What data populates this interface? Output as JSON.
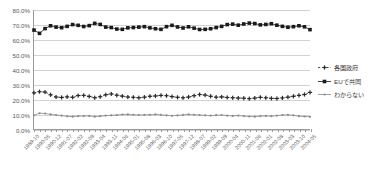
{
  "chart_data": {
    "type": "line",
    "title": "",
    "xlabel": "",
    "ylabel": "",
    "ylim": [
      0,
      80
    ],
    "ytick_values": [
      0,
      10,
      20,
      30,
      40,
      50,
      60,
      70,
      80
    ],
    "ytick_labels": [
      "0.0%",
      "10.0%",
      "20.0%",
      "30.0%",
      "40.0%",
      "50.0%",
      "60.0%",
      "70.0%",
      "80.0%"
    ],
    "grid": true,
    "legend_position": "right",
    "x": [
      "1989-10",
      "1990-01",
      "1990-05",
      "1990-08",
      "1990-12",
      "1991-03",
      "1991-07",
      "1991-10",
      "1992-02",
      "1992-05",
      "1992-09",
      "1992-12",
      "1993-04",
      "1993-07",
      "1993-11",
      "1994-02",
      "1994-06",
      "1994-09",
      "1995-01",
      "1995-04",
      "1995-08",
      "1995-11",
      "1996-03",
      "1996-06",
      "1996-10",
      "1997-01",
      "1997-05",
      "1997-08",
      "1997-12",
      "1998-03",
      "1998-07",
      "1998-10",
      "1999-02",
      "1999-05",
      "1999-09",
      "1999-12",
      "2000-04",
      "2000-07",
      "2000-11",
      "2001-02",
      "2001-06",
      "2001-09",
      "2002-01",
      "2002-04",
      "2002-08",
      "2002-11",
      "2003-03",
      "2003-06",
      "2003-10",
      "2004-01",
      "2004-05"
    ],
    "xtick_labels": [
      "1989-10",
      "1990-05",
      "1990-12",
      "1991-07",
      "1992-02",
      "1992-09",
      "1993-04",
      "1993-11",
      "1994-06",
      "1995-01",
      "1995-08",
      "1996-03",
      "1996-10",
      "1997-05",
      "1997-12",
      "1998-07",
      "1999-02",
      "1999-09",
      "2000-04",
      "2000-11",
      "2001-06",
      "2002-01",
      "2002-08",
      "2003-03",
      "2003-10",
      "2004-05"
    ],
    "xtick_every": 2,
    "series": [
      {
        "name": "EUで共同",
        "color": "#1a1a1a",
        "marker": "square-filled",
        "linestyle": "solid",
        "values": [
          66.5,
          64.3,
          67.5,
          69.4,
          68.5,
          68.1,
          69.0,
          70.2,
          69.7,
          68.9,
          69.5,
          71.0,
          70.3,
          68.5,
          68.2,
          67.2,
          67.0,
          68.0,
          68.2,
          68.5,
          68.8,
          68.0,
          67.4,
          67.0,
          68.8,
          69.7,
          68.6,
          67.9,
          68.7,
          67.8,
          66.9,
          67.0,
          67.4,
          68.2,
          69.0,
          70.2,
          70.5,
          69.8,
          70.6,
          71.2,
          70.9,
          70.0,
          70.3,
          70.8,
          69.8,
          69.0,
          68.4,
          68.8,
          69.4,
          68.7,
          66.8
        ]
      },
      {
        "name": "各国政府",
        "color": "#2a2a2a",
        "marker": "plus-filled",
        "linestyle": "dashed",
        "values": [
          24.3,
          25.1,
          24.8,
          23.0,
          21.5,
          21.2,
          21.6,
          21.3,
          22.5,
          22.6,
          21.9,
          21.0,
          21.7,
          23.0,
          23.6,
          22.7,
          22.1,
          21.5,
          21.3,
          21.0,
          21.4,
          22.0,
          22.2,
          22.6,
          22.4,
          21.8,
          21.3,
          21.0,
          21.5,
          22.4,
          23.2,
          22.8,
          22.0,
          21.4,
          21.6,
          21.2,
          21.0,
          20.8,
          20.7,
          20.4,
          20.8,
          21.3,
          21.0,
          20.6,
          20.5,
          20.9,
          21.4,
          22.0,
          22.6,
          23.2,
          24.6
        ]
      },
      {
        "name": "わからない",
        "color": "#8a8a8a",
        "marker": "diamond-small",
        "linestyle": "solid",
        "values": [
          9.2,
          10.6,
          10.4,
          9.8,
          9.4,
          9.0,
          8.5,
          8.3,
          8.6,
          8.7,
          8.8,
          8.3,
          8.6,
          9.0,
          9.2,
          9.4,
          9.7,
          9.8,
          9.6,
          9.4,
          9.5,
          9.6,
          9.8,
          9.5,
          9.2,
          8.9,
          9.1,
          9.5,
          9.8,
          9.6,
          9.4,
          9.2,
          9.0,
          9.3,
          9.4,
          9.0,
          8.8,
          9.0,
          8.7,
          8.4,
          8.3,
          8.6,
          8.8,
          8.6,
          9.0,
          9.4,
          9.6,
          9.2,
          8.6,
          8.4,
          8.2
        ]
      }
    ]
  },
  "legend": {
    "items": [
      {
        "label": "各国政府",
        "series_index": 1
      },
      {
        "label": "EUで共同",
        "series_index": 0
      },
      {
        "label": "わからない",
        "series_index": 2
      }
    ]
  }
}
